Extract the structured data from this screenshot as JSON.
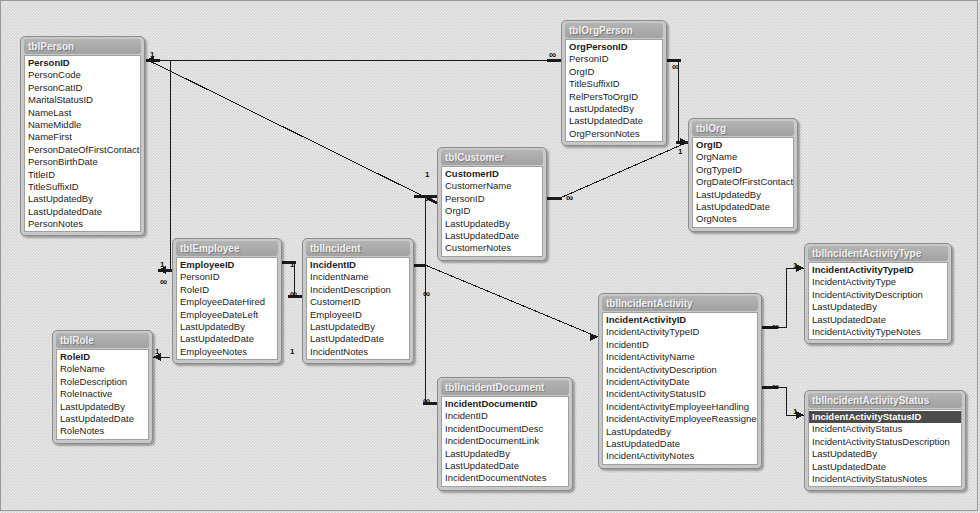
{
  "diagram": {
    "background_color": "#d7d7d7",
    "table_header_color": "#a8a8a8",
    "table_body_color": "#ffffff",
    "line_color": "#1a1a1a",
    "selection_color": "#4b4b4b"
  },
  "tables": [
    {
      "name": "tblPerson",
      "x": 20,
      "y": 36,
      "w": 125,
      "fields": [
        {
          "label": "PersonID",
          "pk": true
        },
        {
          "label": "PersonCode"
        },
        {
          "label": "PersonCatID"
        },
        {
          "label": "MaritalStatusID"
        },
        {
          "label": "NameLast"
        },
        {
          "label": "NameMiddle"
        },
        {
          "label": "NameFirst"
        },
        {
          "label": "PersonDateOfFirstContact"
        },
        {
          "label": "PersonBirthDate"
        },
        {
          "label": "TitleID"
        },
        {
          "label": "TitleSuffixID"
        },
        {
          "label": "LastUpdatedBy"
        },
        {
          "label": "LastUpdatedDate"
        },
        {
          "label": "PersonNotes"
        }
      ]
    },
    {
      "name": "tblEmployee",
      "x": 172,
      "y": 238,
      "w": 110,
      "fields": [
        {
          "label": "EmployeeID",
          "pk": true
        },
        {
          "label": "PersonID"
        },
        {
          "label": "RoleID"
        },
        {
          "label": "EmployeeDateHired"
        },
        {
          "label": "EmployeeDateLeft"
        },
        {
          "label": "LastUpdatedBy"
        },
        {
          "label": "LastUpdatedDate"
        },
        {
          "label": "EmployeeNotes"
        }
      ]
    },
    {
      "name": "tblRole",
      "x": 52,
      "y": 330,
      "w": 101,
      "fields": [
        {
          "label": "RoleID",
          "pk": true
        },
        {
          "label": "RoleName"
        },
        {
          "label": "RoleDescription"
        },
        {
          "label": "RoleInactive"
        },
        {
          "label": "LastUpdatedBy"
        },
        {
          "label": "LastUpdatedDate"
        },
        {
          "label": "RoleNotes"
        }
      ]
    },
    {
      "name": "tblIncident",
      "x": 302,
      "y": 238,
      "w": 112,
      "fields": [
        {
          "label": "IncidentID",
          "pk": true
        },
        {
          "label": "IncidentName"
        },
        {
          "label": "IncidentDescription"
        },
        {
          "label": "CustomerID"
        },
        {
          "label": "EmployeeID"
        },
        {
          "label": "LastUpdatedBy"
        },
        {
          "label": "LastUpdatedDate"
        },
        {
          "label": "IncidentNotes"
        }
      ]
    },
    {
      "name": "tblCustomer",
      "x": 437,
      "y": 147,
      "w": 110,
      "fields": [
        {
          "label": "CustomerID",
          "pk": true
        },
        {
          "label": "CustomerName"
        },
        {
          "label": "PersonID"
        },
        {
          "label": "OrgID"
        },
        {
          "label": "LastUpdatedBy"
        },
        {
          "label": "LastUpdatedDate"
        },
        {
          "label": "CustomerNotes"
        }
      ]
    },
    {
      "name": "tblOrgPerson",
      "x": 561,
      "y": 20,
      "w": 106,
      "fields": [
        {
          "label": "OrgPersonID",
          "pk": true
        },
        {
          "label": "PersonID"
        },
        {
          "label": "OrgID"
        },
        {
          "label": "TitleSuffixID"
        },
        {
          "label": "RelPersToOrgID"
        },
        {
          "label": "LastUpdatedBy"
        },
        {
          "label": "LastUpdatedDate"
        },
        {
          "label": "OrgPersonNotes"
        }
      ]
    },
    {
      "name": "tblOrg",
      "x": 688,
      "y": 118,
      "w": 110,
      "fields": [
        {
          "label": "OrgID",
          "pk": true
        },
        {
          "label": "OrgName"
        },
        {
          "label": "OrgTypeID"
        },
        {
          "label": "OrgDateOfFirstContact"
        },
        {
          "label": "LastUpdatedBy"
        },
        {
          "label": "LastUpdatedDate"
        },
        {
          "label": "OrgNotes"
        }
      ]
    },
    {
      "name": "tblIncidentActivity",
      "x": 598,
      "y": 293,
      "w": 164,
      "fields": [
        {
          "label": "IncidentActivityID",
          "pk": true
        },
        {
          "label": "IncidentActivityTypeID"
        },
        {
          "label": "IncidentID"
        },
        {
          "label": "IncidentActivityName"
        },
        {
          "label": "IncidentActivityDescription"
        },
        {
          "label": "IncidentActivityDate"
        },
        {
          "label": "IncidentActivityStatusID"
        },
        {
          "label": "IncidentActivityEmployeeHandling"
        },
        {
          "label": "IncidentActivityEmployeeReassignedTo"
        },
        {
          "label": "LastUpdatedBy"
        },
        {
          "label": "LastUpdatedDate"
        },
        {
          "label": "IncidentActivityNotes"
        }
      ]
    },
    {
      "name": "tblIncidentActivityType",
      "x": 804,
      "y": 243,
      "w": 148,
      "fields": [
        {
          "label": "IncidentActivityTypeID",
          "pk": true
        },
        {
          "label": "IncidentActivityType"
        },
        {
          "label": "IncidentActivityDescription"
        },
        {
          "label": "LastUpdatedBy"
        },
        {
          "label": "LastUpdatedDate"
        },
        {
          "label": "IncidentActivityTypeNotes"
        }
      ]
    },
    {
      "name": "tblIncidentActivityStatus",
      "x": 804,
      "y": 390,
      "w": 162,
      "fields": [
        {
          "label": "IncidentActivityStatusID",
          "pk": true,
          "selected": true
        },
        {
          "label": "IncidentActivityStatus"
        },
        {
          "label": "IncidentActivityStatusDescription"
        },
        {
          "label": "LastUpdatedBy"
        },
        {
          "label": "LastUpdatedDate"
        },
        {
          "label": "IncidentActivityStatusNotes"
        }
      ]
    },
    {
      "name": "tblIncidentDocument",
      "x": 437,
      "y": 377,
      "w": 136,
      "fields": [
        {
          "label": "IncidentDocumentID",
          "pk": true
        },
        {
          "label": "IncidentID"
        },
        {
          "label": "IncidentDocumentDesc"
        },
        {
          "label": "IncidentDocumentLink"
        },
        {
          "label": "LastUpdatedBy"
        },
        {
          "label": "LastUpdatedDate"
        },
        {
          "label": "IncidentDocumentNotes"
        }
      ]
    }
  ],
  "relationships": [
    {
      "from": "tblPerson.PersonID",
      "to": "tblOrgPerson.PersonID",
      "from_card": "1",
      "to_card": "∞"
    },
    {
      "from": "tblPerson.PersonID",
      "to": "tblCustomer.PersonID",
      "from_card": "1",
      "to_card": "∞"
    },
    {
      "from": "tblPerson.PersonID",
      "to": "tblEmployee.PersonID",
      "from_card": "1",
      "to_card": "∞"
    },
    {
      "from": "tblRole.RoleID",
      "to": "tblEmployee.RoleID",
      "from_card": "1",
      "to_card": "∞"
    },
    {
      "from": "tblEmployee.EmployeeID",
      "to": "tblIncident.EmployeeID",
      "from_card": "1",
      "to_card": "∞"
    },
    {
      "from": "tblCustomer.CustomerID",
      "to": "tblIncident.CustomerID",
      "from_card": "1",
      "to_card": "∞"
    },
    {
      "from": "tblCustomer.OrgID",
      "to": "tblOrg.OrgID",
      "from_card": "∞",
      "to_card": "1"
    },
    {
      "from": "tblOrgPerson.OrgID",
      "to": "tblOrg.OrgID",
      "from_card": "∞",
      "to_card": "1"
    },
    {
      "from": "tblIncident.IncidentID",
      "to": "tblIncidentActivity.IncidentID",
      "from_card": "1",
      "to_card": "∞"
    },
    {
      "from": "tblIncident.IncidentID",
      "to": "tblIncidentDocument.IncidentID",
      "from_card": "1",
      "to_card": "∞"
    },
    {
      "from": "tblIncidentActivity.IncidentActivityTypeID",
      "to": "tblIncidentActivityType.IncidentActivityTypeID",
      "from_card": "∞",
      "to_card": "1"
    },
    {
      "from": "tblIncidentActivity.IncidentActivityStatusID",
      "to": "tblIncidentActivityStatus.IncidentActivityStatusID",
      "from_card": "∞",
      "to_card": "1"
    }
  ],
  "cardinality_markers": [
    {
      "text": "1",
      "x": 150,
      "y": 51
    },
    {
      "text": "∞",
      "x": 549,
      "y": 51
    },
    {
      "text": "∞",
      "x": 672,
      "y": 63
    },
    {
      "text": "1",
      "x": 678,
      "y": 148
    },
    {
      "text": "1",
      "x": 425,
      "y": 171
    },
    {
      "text": "∞",
      "x": 425,
      "y": 195
    },
    {
      "text": "∞",
      "x": 566,
      "y": 194
    },
    {
      "text": "1",
      "x": 160,
      "y": 261
    },
    {
      "text": "∞",
      "x": 160,
      "y": 278
    },
    {
      "text": "1",
      "x": 290,
      "y": 261
    },
    {
      "text": "∞",
      "x": 290,
      "y": 290
    },
    {
      "text": "1",
      "x": 290,
      "y": 348
    },
    {
      "text": "1",
      "x": 155,
      "y": 348
    },
    {
      "text": "∞",
      "x": 423,
      "y": 290
    },
    {
      "text": "∞",
      "x": 423,
      "y": 397
    },
    {
      "text": "∞",
      "x": 772,
      "y": 323
    },
    {
      "text": "1",
      "x": 793,
      "y": 262
    },
    {
      "text": "∞",
      "x": 772,
      "y": 383
    },
    {
      "text": "1",
      "x": 793,
      "y": 408
    }
  ]
}
